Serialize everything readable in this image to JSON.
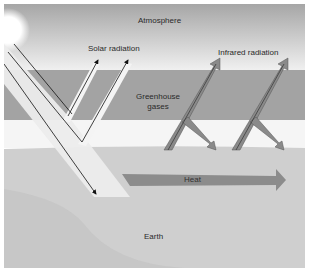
{
  "diagram": {
    "labels": {
      "atmosphere": "Atmosphere",
      "solar_radiation": "Solar radiation",
      "infrared_radiation": "Infrared radiation",
      "greenhouse_gases_line1": "Greenhouse",
      "greenhouse_gases_line2": "gases",
      "heat": "Heat",
      "earth": "Earth"
    },
    "colors": {
      "atmosphere_top": "#a9a9a9",
      "atmosphere_bottom": "#f2f2f2",
      "greenhouse_band": "#a3a3a3",
      "clear_band": "#f5f5f5",
      "earth": "#d0d0d0",
      "earth_dark": "#c4c4c4",
      "solar_beam": "#ededed",
      "infrared_arrow": "#8a8a8a",
      "heat_arrow": "#8e8e8e",
      "sun": "#ffffff"
    }
  }
}
